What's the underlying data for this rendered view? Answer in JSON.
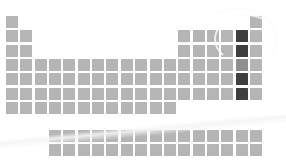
{
  "figure": {
    "background_color": "#ffffff"
  },
  "legend": {
    "normal_label": "Unhighlighted element",
    "highlight_label": "Highlighted element",
    "midtone_label": "Partially highlighted element"
  },
  "colors": {
    "cell_normal": "#b5b5b5",
    "cell_normal_alt": "#bdbdbd",
    "cell_highlight": "#3f3f3f",
    "cell_midtone": "#8f8f8f",
    "background": "#ffffff",
    "gap": "#ffffff"
  },
  "chart_data": {
    "type": "heatmap",
    "xlabel": "Group",
    "ylabel": "Period",
    "grid": false,
    "legend_position": "none",
    "cell_width": 12,
    "cell_height": 12,
    "pitch_x": 14.35,
    "pitch_y": 14.35,
    "origin_x": 6,
    "origin_y": 16,
    "columns": 18,
    "rows": 7,
    "fblock_rows": 2,
    "fblock_columns": 15,
    "fblock_start_column": 4,
    "fblock_origin_y": 130,
    "row_cell_counts": [
      2,
      8,
      8,
      18,
      18,
      18,
      12
    ],
    "cells": [
      {
        "r": 1,
        "c": 1,
        "state": "normal"
      },
      {
        "r": 1,
        "c": 18,
        "state": "normal"
      },
      {
        "r": 2,
        "c": 1,
        "state": "normal"
      },
      {
        "r": 2,
        "c": 2,
        "state": "normal"
      },
      {
        "r": 2,
        "c": 13,
        "state": "normal"
      },
      {
        "r": 2,
        "c": 14,
        "state": "normal"
      },
      {
        "r": 2,
        "c": 15,
        "state": "normal"
      },
      {
        "r": 2,
        "c": 16,
        "state": "normal"
      },
      {
        "r": 2,
        "c": 17,
        "state": "highlight"
      },
      {
        "r": 2,
        "c": 18,
        "state": "normal"
      },
      {
        "r": 3,
        "c": 1,
        "state": "normal"
      },
      {
        "r": 3,
        "c": 2,
        "state": "normal"
      },
      {
        "r": 3,
        "c": 13,
        "state": "normal"
      },
      {
        "r": 3,
        "c": 14,
        "state": "normal"
      },
      {
        "r": 3,
        "c": 15,
        "state": "normal"
      },
      {
        "r": 3,
        "c": 16,
        "state": "normal"
      },
      {
        "r": 3,
        "c": 17,
        "state": "highlight"
      },
      {
        "r": 3,
        "c": 18,
        "state": "normal"
      },
      {
        "r": 4,
        "c": 1,
        "state": "normal"
      },
      {
        "r": 4,
        "c": 2,
        "state": "normal"
      },
      {
        "r": 4,
        "c": 3,
        "state": "normal"
      },
      {
        "r": 4,
        "c": 4,
        "state": "normal"
      },
      {
        "r": 4,
        "c": 5,
        "state": "normal"
      },
      {
        "r": 4,
        "c": 6,
        "state": "normal"
      },
      {
        "r": 4,
        "c": 7,
        "state": "normal"
      },
      {
        "r": 4,
        "c": 8,
        "state": "normal"
      },
      {
        "r": 4,
        "c": 9,
        "state": "normal"
      },
      {
        "r": 4,
        "c": 10,
        "state": "normal"
      },
      {
        "r": 4,
        "c": 11,
        "state": "normal"
      },
      {
        "r": 4,
        "c": 12,
        "state": "normal"
      },
      {
        "r": 4,
        "c": 13,
        "state": "normal"
      },
      {
        "r": 4,
        "c": 14,
        "state": "normal"
      },
      {
        "r": 4,
        "c": 15,
        "state": "normal"
      },
      {
        "r": 4,
        "c": 16,
        "state": "normal"
      },
      {
        "r": 4,
        "c": 17,
        "state": "midtone"
      },
      {
        "r": 4,
        "c": 18,
        "state": "normal"
      },
      {
        "r": 5,
        "c": 1,
        "state": "normal"
      },
      {
        "r": 5,
        "c": 2,
        "state": "normal"
      },
      {
        "r": 5,
        "c": 3,
        "state": "normal"
      },
      {
        "r": 5,
        "c": 4,
        "state": "normal"
      },
      {
        "r": 5,
        "c": 5,
        "state": "normal"
      },
      {
        "r": 5,
        "c": 6,
        "state": "normal"
      },
      {
        "r": 5,
        "c": 7,
        "state": "normal"
      },
      {
        "r": 5,
        "c": 8,
        "state": "normal"
      },
      {
        "r": 5,
        "c": 9,
        "state": "normal"
      },
      {
        "r": 5,
        "c": 10,
        "state": "normal"
      },
      {
        "r": 5,
        "c": 11,
        "state": "normal"
      },
      {
        "r": 5,
        "c": 12,
        "state": "normal"
      },
      {
        "r": 5,
        "c": 13,
        "state": "normal"
      },
      {
        "r": 5,
        "c": 14,
        "state": "normal"
      },
      {
        "r": 5,
        "c": 15,
        "state": "normal"
      },
      {
        "r": 5,
        "c": 16,
        "state": "normal"
      },
      {
        "r": 5,
        "c": 17,
        "state": "highlight"
      },
      {
        "r": 5,
        "c": 18,
        "state": "normal"
      },
      {
        "r": 6,
        "c": 1,
        "state": "normal"
      },
      {
        "r": 6,
        "c": 2,
        "state": "normal"
      },
      {
        "r": 6,
        "c": 3,
        "state": "normal"
      },
      {
        "r": 6,
        "c": 4,
        "state": "normal"
      },
      {
        "r": 6,
        "c": 5,
        "state": "normal"
      },
      {
        "r": 6,
        "c": 6,
        "state": "normal"
      },
      {
        "r": 6,
        "c": 7,
        "state": "normal"
      },
      {
        "r": 6,
        "c": 8,
        "state": "normal"
      },
      {
        "r": 6,
        "c": 9,
        "state": "normal"
      },
      {
        "r": 6,
        "c": 10,
        "state": "normal"
      },
      {
        "r": 6,
        "c": 11,
        "state": "normal"
      },
      {
        "r": 6,
        "c": 12,
        "state": "normal"
      },
      {
        "r": 6,
        "c": 13,
        "state": "normal"
      },
      {
        "r": 6,
        "c": 14,
        "state": "normal"
      },
      {
        "r": 6,
        "c": 15,
        "state": "normal"
      },
      {
        "r": 6,
        "c": 16,
        "state": "normal"
      },
      {
        "r": 6,
        "c": 17,
        "state": "highlight"
      },
      {
        "r": 6,
        "c": 18,
        "state": "normal"
      },
      {
        "r": 7,
        "c": 1,
        "state": "normal"
      },
      {
        "r": 7,
        "c": 2,
        "state": "normal"
      },
      {
        "r": 7,
        "c": 3,
        "state": "normal"
      },
      {
        "r": 7,
        "c": 4,
        "state": "normal"
      },
      {
        "r": 7,
        "c": 5,
        "state": "normal"
      },
      {
        "r": 7,
        "c": 6,
        "state": "normal"
      },
      {
        "r": 7,
        "c": 7,
        "state": "normal"
      },
      {
        "r": 7,
        "c": 8,
        "state": "normal"
      },
      {
        "r": 7,
        "c": 9,
        "state": "normal"
      },
      {
        "r": 7,
        "c": 10,
        "state": "normal"
      },
      {
        "r": 7,
        "c": 11,
        "state": "normal"
      },
      {
        "r": 7,
        "c": 12,
        "state": "normal"
      }
    ],
    "fblock_cells": [
      {
        "r": 1,
        "c": 1,
        "state": "normal"
      },
      {
        "r": 1,
        "c": 2,
        "state": "normal"
      },
      {
        "r": 1,
        "c": 3,
        "state": "normal"
      },
      {
        "r": 1,
        "c": 4,
        "state": "normal"
      },
      {
        "r": 1,
        "c": 5,
        "state": "normal"
      },
      {
        "r": 1,
        "c": 6,
        "state": "normal"
      },
      {
        "r": 1,
        "c": 7,
        "state": "normal"
      },
      {
        "r": 1,
        "c": 8,
        "state": "normal"
      },
      {
        "r": 1,
        "c": 9,
        "state": "normal"
      },
      {
        "r": 1,
        "c": 10,
        "state": "normal"
      },
      {
        "r": 1,
        "c": 11,
        "state": "normal"
      },
      {
        "r": 1,
        "c": 12,
        "state": "normal"
      },
      {
        "r": 1,
        "c": 13,
        "state": "normal"
      },
      {
        "r": 1,
        "c": 14,
        "state": "normal"
      },
      {
        "r": 1,
        "c": 15,
        "state": "normal"
      },
      {
        "r": 2,
        "c": 1,
        "state": "normal"
      },
      {
        "r": 2,
        "c": 2,
        "state": "normal"
      },
      {
        "r": 2,
        "c": 3,
        "state": "normal"
      },
      {
        "r": 2,
        "c": 4,
        "state": "normal"
      },
      {
        "r": 2,
        "c": 5,
        "state": "normal"
      },
      {
        "r": 2,
        "c": 6,
        "state": "normal"
      },
      {
        "r": 2,
        "c": 7,
        "state": "normal"
      },
      {
        "r": 2,
        "c": 8,
        "state": "normal"
      },
      {
        "r": 2,
        "c": 9,
        "state": "normal"
      },
      {
        "r": 2,
        "c": 10,
        "state": "normal"
      },
      {
        "r": 2,
        "c": 11,
        "state": "normal"
      },
      {
        "r": 2,
        "c": 12,
        "state": "normal"
      },
      {
        "r": 2,
        "c": 13,
        "state": "normal"
      },
      {
        "r": 2,
        "c": 14,
        "state": "normal"
      },
      {
        "r": 2,
        "c": 15,
        "state": "normal"
      }
    ]
  }
}
